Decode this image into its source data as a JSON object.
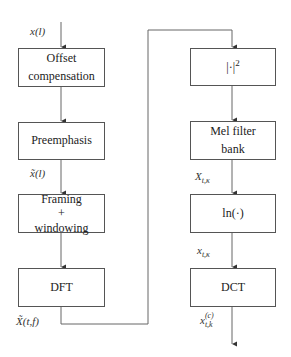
{
  "diagram": {
    "left_column": [
      {
        "id": "offset",
        "label_line1": "Offset",
        "label_line2": "compensation"
      },
      {
        "id": "preemphasis",
        "label": "Preemphasis"
      },
      {
        "id": "framing",
        "label_line1": "Framing",
        "label_line2": "+",
        "label_line3": "windowing"
      },
      {
        "id": "dft",
        "label": "DFT"
      }
    ],
    "right_column": [
      {
        "id": "magsq",
        "label": "|·|",
        "superscript": "2"
      },
      {
        "id": "mel",
        "label_line1": "Mel filter",
        "label_line2": "bank"
      },
      {
        "id": "ln",
        "label": "ln(·)"
      },
      {
        "id": "dct",
        "label": "DCT"
      }
    ],
    "signals": {
      "input": {
        "base": "x(l)"
      },
      "preemph_out": {
        "base": "x̃(l)"
      },
      "dft_out": {
        "base": "X̃(t,f)"
      },
      "mel_out": {
        "base": "X",
        "sub": "t,κ"
      },
      "ln_out": {
        "base": "x",
        "sub": "t,κ"
      },
      "dct_out": {
        "base": "x",
        "sup": "(c)",
        "sub": "t,k"
      }
    },
    "colors": {
      "line": "#555555",
      "text": "#222222"
    }
  }
}
